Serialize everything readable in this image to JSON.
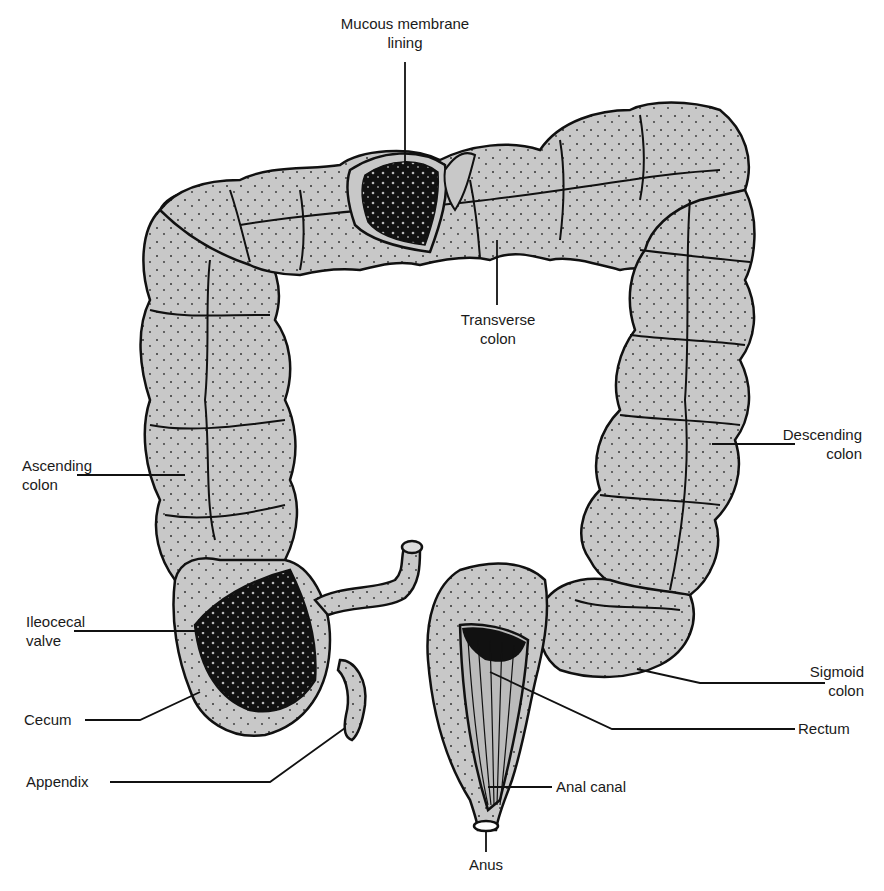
{
  "diagram": {
    "colors": {
      "tissue_fill": "#c8c8c8",
      "outline": "#111111",
      "mucosa": "#0d0d0d",
      "background": "#ffffff",
      "text": "#1a1a1a"
    },
    "labels": {
      "mucous_membrane": {
        "line1": "Mucous membrane",
        "line2": "lining"
      },
      "transverse_colon": {
        "line1": "Transverse",
        "line2": "colon"
      },
      "ascending_colon": {
        "line1": "Ascending",
        "line2": "colon"
      },
      "descending_colon": {
        "line1": "Descending",
        "line2": "colon"
      },
      "ileocecal_valve": {
        "line1": "Ileocecal",
        "line2": "valve"
      },
      "cecum": "Cecum",
      "appendix": "Appendix",
      "sigmoid_colon": {
        "line1": "Sigmoid",
        "line2": "colon"
      },
      "rectum": "Rectum",
      "anal_canal": "Anal canal",
      "anus": "Anus"
    }
  }
}
